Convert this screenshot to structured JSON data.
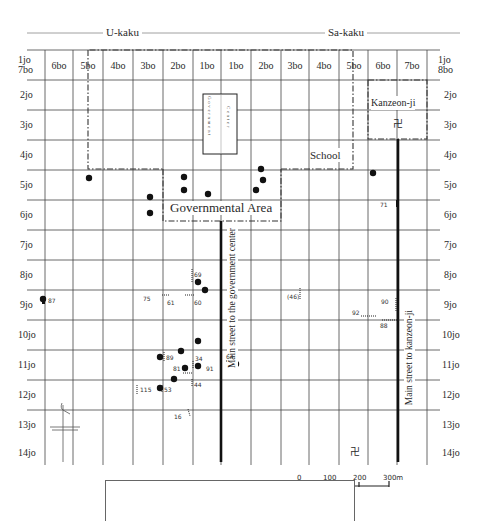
{
  "map": {
    "kaku": [
      {
        "label": "U-kaku",
        "x": 103,
        "y": 26
      },
      {
        "label": "Sa-kaku",
        "x": 325,
        "y": 26
      }
    ],
    "columns": [
      {
        "label": "6bo",
        "x": 59
      },
      {
        "label": "5bo",
        "x": 88
      },
      {
        "label": "4bo",
        "x": 118
      },
      {
        "label": "3bo",
        "x": 148
      },
      {
        "label": "2bo",
        "x": 178
      },
      {
        "label": "1bo",
        "x": 207
      },
      {
        "label": "1bo",
        "x": 236
      },
      {
        "label": "2bo",
        "x": 266
      },
      {
        "label": "3bo",
        "x": 295
      },
      {
        "label": "4bo",
        "x": 324
      },
      {
        "label": "5bo",
        "x": 354
      },
      {
        "label": "6bo",
        "x": 383
      },
      {
        "label": "7bo",
        "x": 412
      }
    ],
    "corner_left": {
      "line1": "1jo",
      "line2": "7bo"
    },
    "corner_right": {
      "line1": "1jo",
      "line2": "8bo"
    },
    "rows_left": [
      "2jo",
      "3jo",
      "4jo",
      "5jo",
      "6jo",
      "7jo",
      "8jo",
      "9jo",
      "10jo",
      "11jo",
      "12jo",
      "13jo",
      "14jo"
    ],
    "rows_right": [
      "2jo",
      "3jo",
      "4jo",
      "5jo",
      "6jo",
      "7jo",
      "8jo",
      "9jo",
      "10jo",
      "11jo",
      "12jo",
      "13jo",
      "14jo"
    ],
    "areas": {
      "government_center": "Government Center",
      "governmental_area": "Governmental Area",
      "school": "School",
      "kanzeon_ji": "Kanzeon-ji"
    },
    "streets": {
      "gov_center": "Main street to the government center",
      "kanzeon_ji": "Main street to kanzeon-ji"
    },
    "temple_symbol": "卍",
    "sites": [
      {
        "label": "87",
        "x": 47,
        "y": 300
      },
      {
        "label": "75",
        "x": 143,
        "y": 296
      },
      {
        "label": "61",
        "x": 168,
        "y": 300
      },
      {
        "label": "60",
        "x": 195,
        "y": 300
      },
      {
        "label": "69",
        "x": 194,
        "y": 272
      },
      {
        "label": "(46)",
        "x": 288,
        "y": 293
      },
      {
        "label": "90",
        "x": 383,
        "y": 299
      },
      {
        "label": "92",
        "x": 353,
        "y": 310
      },
      {
        "label": "88",
        "x": 380,
        "y": 322
      },
      {
        "label": "71",
        "x": 387,
        "y": 202
      },
      {
        "label": "89",
        "x": 168,
        "y": 355
      },
      {
        "label": "34",
        "x": 195,
        "y": 355
      },
      {
        "label": "64",
        "x": 226,
        "y": 353
      },
      {
        "label": "81",
        "x": 173,
        "y": 366
      },
      {
        "label": "91",
        "x": 207,
        "y": 366
      },
      {
        "label": "44",
        "x": 195,
        "y": 381
      },
      {
        "label": "115",
        "x": 140,
        "y": 386
      },
      {
        "label": "53",
        "x": 165,
        "y": 386
      },
      {
        "label": "16",
        "x": 173,
        "y": 413
      }
    ],
    "dots": [
      [
        89,
        178
      ],
      [
        184,
        177
      ],
      [
        184,
        190
      ],
      [
        208,
        194
      ],
      [
        150,
        197
      ],
      [
        150,
        213
      ],
      [
        261,
        169
      ],
      [
        263,
        180
      ],
      [
        256,
        190
      ],
      [
        373,
        173
      ],
      [
        43,
        299
      ],
      [
        197,
        283
      ],
      [
        205,
        290
      ],
      [
        197,
        341
      ],
      [
        181,
        350
      ],
      [
        160,
        357
      ],
      [
        185,
        368
      ],
      [
        197,
        366
      ],
      [
        236,
        365
      ],
      [
        174,
        379
      ],
      [
        160,
        388
      ]
    ],
    "scale": {
      "ticks": [
        "0",
        "100",
        "200",
        "300m"
      ]
    }
  }
}
